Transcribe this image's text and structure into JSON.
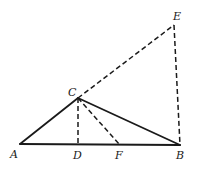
{
  "diagram": {
    "type": "geometry",
    "points": {
      "A": {
        "label": "A",
        "x": 20,
        "y": 144
      },
      "B": {
        "label": "B",
        "x": 180,
        "y": 145
      },
      "C": {
        "label": "C",
        "x": 78,
        "y": 98
      },
      "D": {
        "label": "D",
        "x": 78,
        "y": 144
      },
      "E": {
        "label": "E",
        "x": 174,
        "y": 25
      },
      "F": {
        "label": "F",
        "x": 119,
        "y": 144
      }
    },
    "segments": [
      {
        "from": "A",
        "to": "B",
        "style": "solid"
      },
      {
        "from": "A",
        "to": "C",
        "style": "solid"
      },
      {
        "from": "C",
        "to": "B",
        "style": "solid"
      },
      {
        "from": "C",
        "to": "E",
        "style": "dashed"
      },
      {
        "from": "E",
        "to": "B",
        "style": "dashed"
      },
      {
        "from": "C",
        "to": "D",
        "style": "dashed"
      },
      {
        "from": "C",
        "to": "F",
        "style": "dashed"
      }
    ],
    "labels": {
      "A": "A",
      "B": "B",
      "C": "C",
      "D": "D",
      "E": "E",
      "F": "F"
    }
  }
}
